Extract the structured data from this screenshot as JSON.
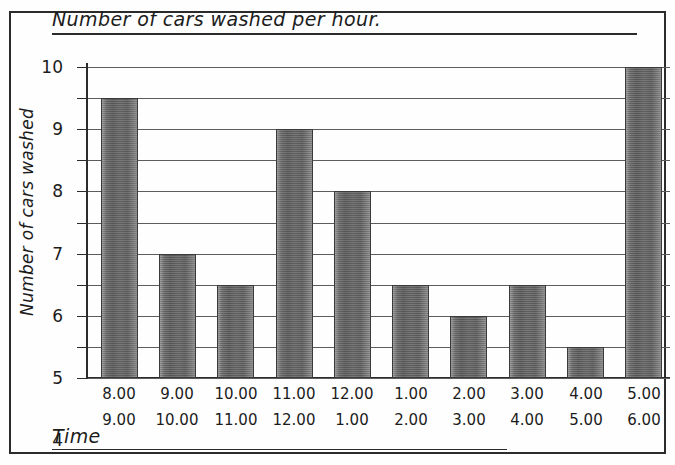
{
  "page": {
    "top_cut_text": "¦ ¦ ¦"
  },
  "chart_data": {
    "type": "bar",
    "title": "Number of cars washed per hour.",
    "xlabel": "Time",
    "ylabel": "Number of cars washed",
    "ylim": [
      0,
      10
    ],
    "ytick_step": 1,
    "grid": true,
    "legend": null,
    "categories": [
      "8.00 9.00",
      "9.00 10.00",
      "10.00 11.00",
      "11.00 12.00",
      "12.00 1.00",
      "1.00 2.00",
      "2.00 3.00",
      "3.00 4.00",
      "4.00 5.00",
      "5.00 6.00"
    ],
    "category_rows": [
      {
        "start": "8.00",
        "end": "9.00"
      },
      {
        "start": "9.00",
        "end": "10.00"
      },
      {
        "start": "10.00",
        "end": "11.00"
      },
      {
        "start": "11.00",
        "end": "12.00"
      },
      {
        "start": "12.00",
        "end": "1.00"
      },
      {
        "start": "1.00",
        "end": "2.00"
      },
      {
        "start": "2.00",
        "end": "3.00"
      },
      {
        "start": "3.00",
        "end": "4.00"
      },
      {
        "start": "4.00",
        "end": "5.00"
      },
      {
        "start": "5.00",
        "end": "6.00"
      }
    ],
    "values": [
      9,
      4,
      3,
      8,
      6,
      3,
      2,
      3,
      1,
      10
    ],
    "ytick_labels": [
      "10",
      "9",
      "8",
      "7",
      "6",
      "5",
      "4",
      "3",
      "2",
      "1",
      "0"
    ],
    "bar_color": "#6a6a6a",
    "grid_color": "#5c5c5c",
    "axis_color": "#2b2b2b"
  }
}
